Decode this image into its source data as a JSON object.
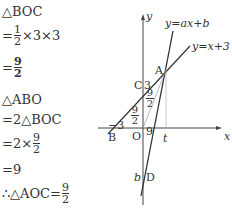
{
  "steps": [
    {
      "text": "△BOC"
    },
    {
      "prefix": "=",
      "frac": {
        "num": "1",
        "den": "2"
      },
      "suffix": "×3×3"
    },
    {
      "prefix": "=",
      "frac": {
        "num": "9",
        "den": "2"
      },
      "bold": true
    },
    {
      "text": "△ABO"
    },
    {
      "text": "=2△BOC"
    },
    {
      "prefix": "=2×",
      "frac": {
        "num": "9",
        "den": "2"
      }
    },
    {
      "text": "=9"
    },
    {
      "prefix": "∴△AOC=",
      "frac": {
        "num": "9",
        "den": "2"
      }
    }
  ],
  "graph": {
    "y_axis_label": "y",
    "x_axis_label": "x",
    "line1_label": "y=ax+b",
    "line2_label": "y=x+3",
    "points": {
      "A": "A",
      "B": "B",
      "C": "C",
      "O": "O",
      "D": "D"
    },
    "labels": {
      "minus3": "−3",
      "three": "3",
      "nine": "9",
      "t": "t",
      "b": "b",
      "frac_left": {
        "num": "9",
        "den": "2"
      },
      "frac_right": {
        "num": "9",
        "den": "2"
      }
    }
  }
}
